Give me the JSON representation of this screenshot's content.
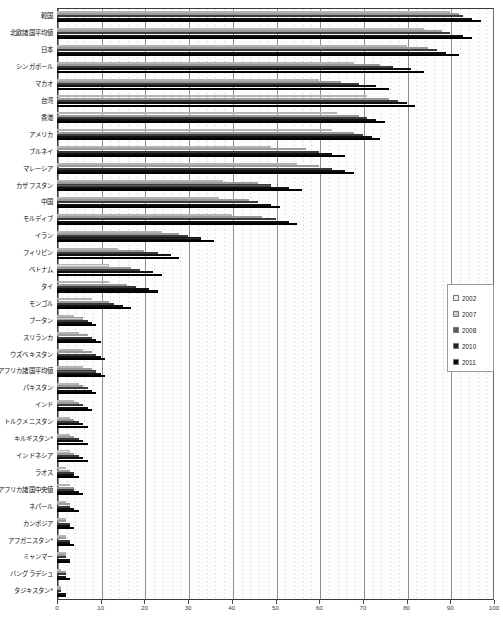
{
  "chart_data": {
    "type": "bar",
    "orientation": "horizontal",
    "title": "",
    "xlabel": "",
    "ylabel": "",
    "xlim": [
      0,
      100
    ],
    "xticks": [
      0,
      10,
      20,
      30,
      40,
      50,
      60,
      70,
      80,
      90,
      100
    ],
    "xtick_labels": [
      "0",
      "10",
      "20",
      "30",
      "40",
      "50",
      "60",
      "70",
      "80",
      "90",
      "100"
    ],
    "grid": true,
    "grid_axis": "x",
    "legend_position": "right-middle",
    "legend_entries": [
      "2002",
      "2007",
      "2008",
      "2010",
      "2011"
    ],
    "series": [
      {
        "name": "2002",
        "color": "#e9e9e9",
        "values": [
          90,
          84,
          80,
          68,
          60,
          71,
          64,
          63,
          49,
          55,
          38,
          37,
          40,
          24,
          14,
          12,
          12,
          8,
          4,
          5,
          6,
          6,
          5,
          4,
          3,
          3,
          3,
          2,
          3,
          2,
          2,
          2,
          2,
          1,
          1
        ]
      },
      {
        "name": "2007",
        "color": "#cfcfcf",
        "values": [
          92,
          88,
          85,
          74,
          65,
          76,
          69,
          68,
          57,
          60,
          46,
          44,
          47,
          28,
          20,
          17,
          16,
          12,
          6,
          7,
          8,
          8,
          6,
          5,
          4,
          4,
          4,
          3,
          4,
          3,
          2,
          2,
          2,
          2,
          1
        ]
      },
      {
        "name": "2008",
        "color": "#5d5d5d",
        "values": [
          93,
          90,
          87,
          77,
          69,
          78,
          71,
          70,
          60,
          63,
          49,
          46,
          50,
          30,
          23,
          19,
          18,
          13,
          7,
          8,
          9,
          9,
          7,
          6,
          5,
          5,
          5,
          4,
          4,
          3,
          3,
          3,
          2,
          2,
          1
        ]
      },
      {
        "name": "2010",
        "color": "#2a2a2a",
        "values": [
          95,
          93,
          89,
          81,
          73,
          80,
          73,
          72,
          63,
          66,
          53,
          49,
          53,
          33,
          26,
          22,
          21,
          15,
          8,
          9,
          10,
          10,
          8,
          7,
          6,
          6,
          6,
          4,
          5,
          4,
          3,
          3,
          3,
          2,
          2
        ]
      },
      {
        "name": "2011",
        "color": "#0d0d0d",
        "values": [
          97,
          95,
          92,
          84,
          76,
          82,
          75,
          74,
          66,
          68,
          56,
          51,
          55,
          36,
          28,
          24,
          23,
          17,
          9,
          10,
          11,
          11,
          9,
          8,
          7,
          7,
          7,
          5,
          6,
          5,
          4,
          4,
          3,
          3,
          2
        ]
      }
    ],
    "categories": [
      "韓国",
      "北欧諸国平均値",
      "日本",
      "シンガポール",
      "マカオ",
      "台湾",
      "香港",
      "アメリカ",
      "ブルネイ",
      "マレーシア",
      "カザフスタン",
      "中国",
      "モルディブ",
      "イラン",
      "フィリピン",
      "ベトナム",
      "タイ",
      "モンゴル",
      "ブータン",
      "スリランカ",
      "ウズベキスタン",
      "アフリカ諸国平均値",
      "パキスタン",
      "インド",
      "トルクメニスタン",
      "キルギスタン*",
      "インドネシア",
      "ラオス",
      "アフリカ諸国中央値",
      "ネパール",
      "カンボジア",
      "アフガニスタン*",
      "ミャンマー",
      "バングラデシュ",
      "タジキスタン*"
    ]
  },
  "caption": {
    "text": ""
  }
}
